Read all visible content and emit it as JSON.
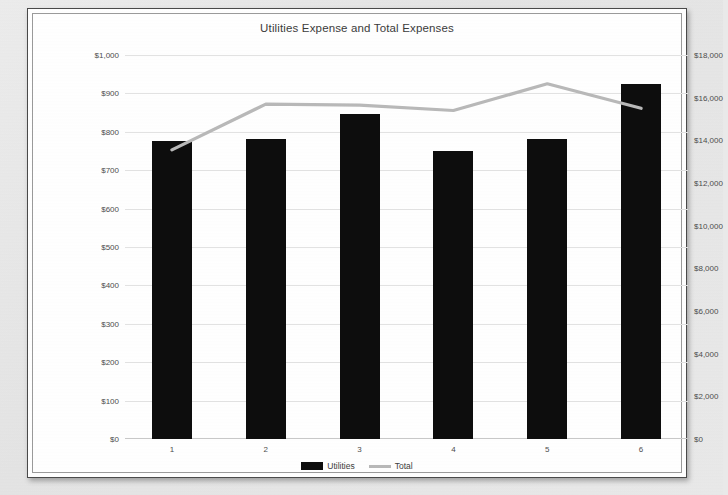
{
  "chart_data": {
    "type": "bar",
    "title": "Utilities Expense and Total Expenses",
    "categories": [
      "1",
      "2",
      "3",
      "4",
      "5",
      "6"
    ],
    "xlabel": "",
    "series": [
      {
        "name": "Utilities",
        "type": "bar",
        "axis": "left",
        "color": "#0d0d0d",
        "values": [
          775,
          780,
          847,
          750,
          780,
          925
        ]
      },
      {
        "name": "Total",
        "type": "line",
        "axis": "right",
        "color": "#b9b9b9",
        "values": [
          13550,
          15700,
          15650,
          15400,
          16650,
          15500
        ]
      }
    ],
    "left_axis": {
      "label": "",
      "ylim": [
        0,
        1000
      ],
      "ticks": [
        "$0",
        "$100",
        "$200",
        "$300",
        "$400",
        "$500",
        "$600",
        "$700",
        "$800",
        "$900",
        "$1,000"
      ],
      "tick_values": [
        0,
        100,
        200,
        300,
        400,
        500,
        600,
        700,
        800,
        900,
        1000
      ]
    },
    "right_axis": {
      "label": "",
      "ylim": [
        0,
        18000
      ],
      "ticks": [
        "$0",
        "$2,000",
        "$4,000",
        "$6,000",
        "$8,000",
        "$10,000",
        "$12,000",
        "$14,000",
        "$16,000",
        "$18,000"
      ],
      "tick_values": [
        0,
        2000,
        4000,
        6000,
        8000,
        10000,
        12000,
        14000,
        16000,
        18000
      ]
    },
    "grid": true,
    "legend_position": "bottom",
    "legend": [
      "Utilities",
      "Total"
    ]
  }
}
